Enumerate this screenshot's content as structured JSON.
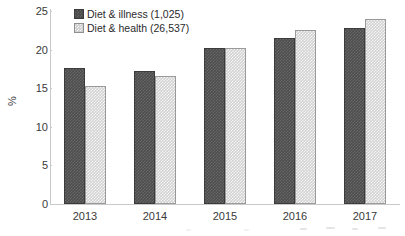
{
  "chart_data": {
    "type": "bar",
    "title": "",
    "subtitle": "",
    "xlabel": "",
    "ylabel": "%",
    "categories": [
      "2013",
      "2014",
      "2015",
      "2016",
      "2017"
    ],
    "series": [
      {
        "name": "Diet & illness (1,025)",
        "short_name": "Diet & illness",
        "count": "1,025",
        "color": "#4d4d4d",
        "values": [
          17.6,
          17.2,
          20.2,
          21.5,
          22.8
        ]
      },
      {
        "name": "Diet & health (26,537)",
        "short_name": "Diet & health",
        "count": "26,537",
        "color": "#d2d2d2",
        "values": [
          15.3,
          16.6,
          20.2,
          22.6,
          24.0
        ]
      }
    ],
    "ylim": [
      0,
      25
    ],
    "yticks": [
      "0",
      "5",
      "10",
      "15",
      "20",
      "25"
    ],
    "ytick_values": [
      0,
      5,
      10,
      15,
      20,
      25
    ],
    "grid": false,
    "legend_position": "top-left"
  },
  "axes": {
    "y_title": "%",
    "y_labels": [
      "25",
      "20",
      "15",
      "10",
      "5",
      "0"
    ],
    "x_labels": [
      "2013",
      "2014",
      "2015",
      "2016",
      "2017"
    ]
  },
  "legend": {
    "items": [
      {
        "label": "Diet & illness (1,025)",
        "swatch": "dark-checkered-swatch"
      },
      {
        "label": "Diet & health (26,537)",
        "swatch": "light-checkered-swatch"
      }
    ]
  },
  "colors": {
    "series_dark": "#4d4d4d",
    "series_light": "#d2d2d2",
    "axis": "#c9c9c9",
    "text": "#2b2b2b",
    "background": "#ffffff"
  }
}
